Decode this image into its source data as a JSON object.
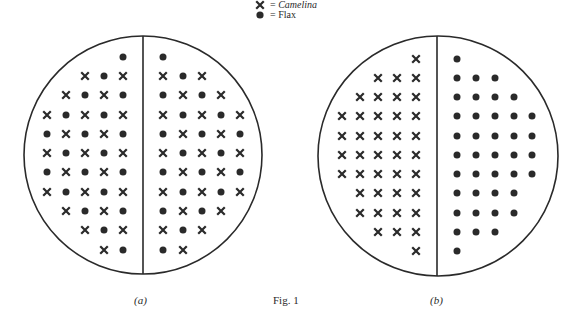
{
  "legend": {
    "items": [
      {
        "symbol": "cross",
        "eq": "=",
        "label": "Camelina",
        "italic": true
      },
      {
        "symbol": "dot",
        "eq": "=",
        "label": "Flax",
        "italic": false
      }
    ]
  },
  "captions": {
    "a": "(a)",
    "fig": "Fig. 1",
    "b": "(b)"
  },
  "colors": {
    "ink": "#2a2a2a",
    "background": "#ffffff"
  },
  "plots": [
    {
      "id": "a",
      "cx": 143,
      "cy": 155,
      "r": 119,
      "divider_x": 143,
      "row_y": [
        57,
        76,
        95,
        115,
        134,
        153,
        172,
        192,
        211,
        230,
        250
      ],
      "left_cols_x": [
        47,
        66,
        85,
        104,
        123
      ],
      "right_cols_x": [
        163,
        183,
        202,
        221,
        240
      ],
      "left_grid": [
        "....O",
        "..XOX",
        ".XOXO",
        "XOXOX",
        "OXOXO",
        "XOXOX",
        "OXOXO",
        "XOXOX",
        ".XOXO",
        "..XOX",
        "...XO"
      ],
      "right_grid": [
        "O....",
        "XOX..",
        "OXOX.",
        "XOXOX",
        "OXOXO",
        "XOXOX",
        "OXOXO",
        "XOXOX",
        "OXOX.",
        "XOX..",
        "OX..."
      ]
    },
    {
      "id": "b",
      "cx": 438,
      "cy": 156,
      "r": 120,
      "divider_x": 437,
      "row_y": [
        59,
        78,
        97,
        116,
        136,
        155,
        174,
        193,
        213,
        232,
        251
      ],
      "left_cols_x": [
        342,
        360,
        378,
        397,
        416
      ],
      "right_cols_x": [
        457,
        476,
        495,
        514,
        532
      ],
      "left_grid": [
        "....X",
        "..XXX",
        ".XXXX",
        "XXXXX",
        "XXXXX",
        "XXXXX",
        "XXXXX",
        ".XXXX",
        ".XXXX",
        "..XXX",
        "....X"
      ],
      "right_grid": [
        "O....",
        "OOO..",
        "OOOO.",
        "OOOOO",
        "OOOOO",
        "OOOOO",
        "OOOOO",
        "OOOO.",
        "OOOO.",
        "OOO..",
        "O...."
      ]
    }
  ]
}
